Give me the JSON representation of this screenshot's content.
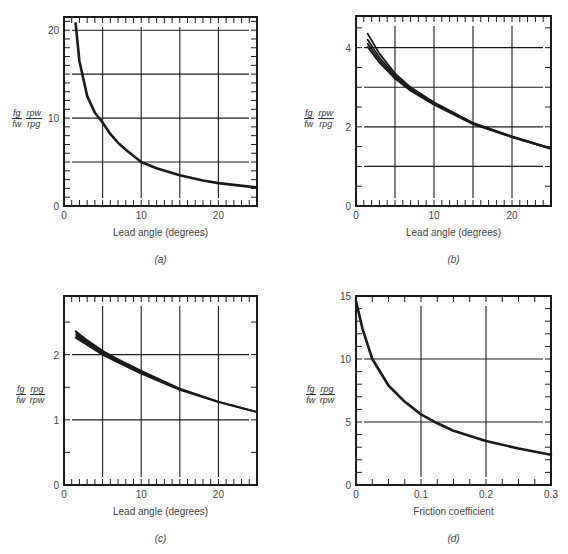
{
  "chart_data": [
    {
      "id": "a",
      "type": "line",
      "caption": "(a)",
      "title": "",
      "xlabel": "Lead angle (degrees)",
      "ylabel": "f_g/f_w · r_pw/r_pg",
      "ylabel_parts": {
        "num1": "fg",
        "den1": "fw",
        "num2": "rpw",
        "den2": "rpg"
      },
      "xlim": [
        0,
        25
      ],
      "ylim": [
        0,
        21.5
      ],
      "xticks": [
        0,
        10,
        20
      ],
      "yticks": [
        0,
        10,
        20
      ],
      "grid_x": [
        5,
        10,
        15,
        20
      ],
      "grid_y": [
        5,
        10,
        15,
        20
      ],
      "grid": true,
      "series": [
        {
          "name": "curve",
          "x": [
            1.5,
            2,
            3,
            4,
            5,
            6,
            7,
            8,
            10,
            12,
            15,
            18,
            20,
            22,
            25
          ],
          "y": [
            20.8,
            16.5,
            12.5,
            10.6,
            9.5,
            8.2,
            7.2,
            6.4,
            5.0,
            4.3,
            3.5,
            2.9,
            2.6,
            2.4,
            2.1
          ]
        }
      ]
    },
    {
      "id": "b",
      "type": "line",
      "caption": "(b)",
      "title": "",
      "xlabel": "Lead angle (degrees)",
      "ylabel": "f_g/f_w · r_pw/r_pg",
      "ylabel_parts": {
        "num1": "fg",
        "den1": "fw",
        "num2": "rpw",
        "den2": "rpg"
      },
      "xlim": [
        0,
        25
      ],
      "ylim": [
        0,
        4.8
      ],
      "xticks": [
        0,
        10,
        20
      ],
      "yticks": [
        0,
        2,
        4
      ],
      "grid_x": [
        5,
        10,
        15,
        20
      ],
      "grid_y": [
        1,
        2,
        3,
        4
      ],
      "grid": true,
      "series": [
        {
          "name": "curve-1",
          "x": [
            1.5,
            3,
            5,
            7,
            10,
            15,
            20,
            25
          ],
          "y": [
            4.35,
            3.85,
            3.35,
            3.0,
            2.62,
            2.1,
            1.76,
            1.46
          ]
        },
        {
          "name": "curve-2",
          "x": [
            1.5,
            3,
            5,
            7,
            10,
            15,
            20,
            25
          ],
          "y": [
            4.2,
            3.75,
            3.3,
            2.97,
            2.6,
            2.09,
            1.75,
            1.45
          ]
        },
        {
          "name": "curve-3",
          "x": [
            1.5,
            3,
            5,
            7,
            10,
            15,
            20,
            25
          ],
          "y": [
            4.1,
            3.68,
            3.26,
            2.94,
            2.58,
            2.08,
            1.74,
            1.45
          ]
        },
        {
          "name": "curve-4",
          "x": [
            1.5,
            3,
            5,
            7,
            10,
            15,
            20,
            25
          ],
          "y": [
            4.02,
            3.62,
            3.22,
            2.91,
            2.56,
            2.07,
            1.74,
            1.44
          ]
        }
      ]
    },
    {
      "id": "c",
      "type": "line",
      "caption": "(c)",
      "title": "",
      "xlabel": "Lead angle (degrees)",
      "ylabel": "f_g/f_w · r_pg/r_pw",
      "ylabel_parts": {
        "num1": "fg",
        "den1": "fw",
        "num2": "rpg",
        "den2": "rpw"
      },
      "xlim": [
        0,
        25
      ],
      "ylim": [
        0,
        2.9
      ],
      "xticks": [
        0,
        10,
        20
      ],
      "yticks": [
        0,
        1,
        2
      ],
      "grid_x": [
        5,
        10,
        15,
        20
      ],
      "grid_y": [
        1,
        2
      ],
      "grid": true,
      "series": [
        {
          "name": "curve-upper",
          "x": [
            1.5,
            3,
            5,
            7,
            10,
            15,
            20,
            25
          ],
          "y": [
            2.36,
            2.22,
            2.06,
            1.93,
            1.75,
            1.48,
            1.28,
            1.12
          ]
        },
        {
          "name": "curve-lower",
          "x": [
            1.5,
            3,
            5,
            7,
            10,
            15,
            20,
            25
          ],
          "y": [
            2.26,
            2.15,
            2.0,
            1.88,
            1.71,
            1.46,
            1.27,
            1.12
          ]
        }
      ]
    },
    {
      "id": "d",
      "type": "line",
      "caption": "(d)",
      "title": "",
      "xlabel": "Friction coefficient",
      "ylabel": "f_g/f_w · r_pg/r_pw",
      "ylabel_parts": {
        "num1": "fg",
        "den1": "fw",
        "num2": "rpg",
        "den2": "rpw"
      },
      "xlim": [
        0,
        0.3
      ],
      "ylim": [
        0,
        15
      ],
      "xticks": [
        0,
        0.1,
        0.2,
        0.3
      ],
      "yticks": [
        0,
        5,
        10,
        15
      ],
      "grid_x": [
        0.1,
        0.2
      ],
      "grid_y": [
        5,
        10
      ],
      "grid": true,
      "series": [
        {
          "name": "curve",
          "x": [
            0,
            0.01,
            0.025,
            0.05,
            0.075,
            0.1,
            0.125,
            0.15,
            0.2,
            0.25,
            0.3
          ],
          "y": [
            14.6,
            12.4,
            10.0,
            7.9,
            6.6,
            5.6,
            4.9,
            4.3,
            3.5,
            2.9,
            2.4
          ]
        }
      ]
    }
  ]
}
